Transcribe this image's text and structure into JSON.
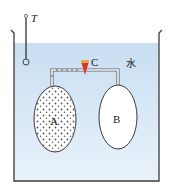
{
  "diagram": {
    "labels": {
      "thermometer": "T",
      "valve": "C",
      "water": "水",
      "container_a": "A",
      "container_b": "B"
    },
    "colors": {
      "water": "#cfe3f3",
      "water_light": "#e6f0f9",
      "outline": "#3a3a3a",
      "valve_top": "#e8a54a",
      "valve_body": "#d23a2a",
      "gas_dots": "#555555"
    }
  }
}
